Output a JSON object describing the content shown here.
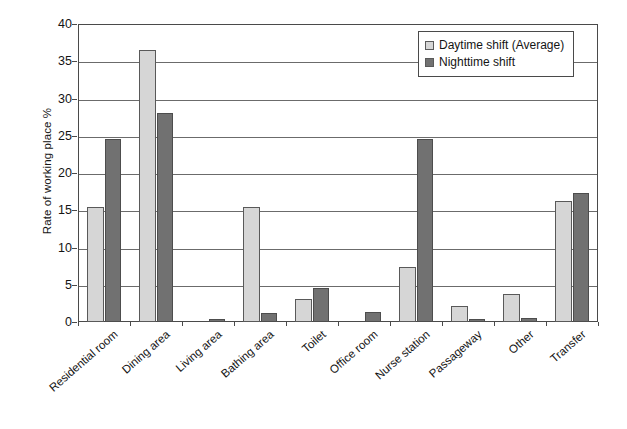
{
  "chart_data": {
    "type": "bar",
    "title": "",
    "xlabel": "",
    "ylabel": "Rate of working place  %",
    "ylim": [
      0,
      40
    ],
    "yticks": [
      0,
      5,
      10,
      15,
      20,
      25,
      30,
      35,
      40
    ],
    "ytick_labels": [
      "0",
      "5",
      "10",
      "15",
      "20",
      "25",
      "30",
      "35",
      "40"
    ],
    "grid": true,
    "legend_position": "top-right",
    "categories": [
      "Residential room",
      "Dining area",
      "Living area",
      "Bathing area",
      "Toilet",
      "Office room",
      "Nurse station",
      "Passageway",
      "Other",
      "Transfer"
    ],
    "series": [
      {
        "name": "Daytime shift (Average)",
        "color": "#d6d6d6",
        "values": [
          15.4,
          36.5,
          0.0,
          15.4,
          3.1,
          0.0,
          7.4,
          2.2,
          3.8,
          16.3
        ]
      },
      {
        "name": "Nighttime shift",
        "color": "#717171",
        "values": [
          24.5,
          28.0,
          0.4,
          1.2,
          4.6,
          1.4,
          24.6,
          0.4,
          0.5,
          17.3
        ]
      }
    ]
  },
  "legend": {
    "items": [
      {
        "label": "Daytime shift (Average)",
        "swatch": "light"
      },
      {
        "label": "Nighttime shift",
        "swatch": "dark"
      }
    ]
  },
  "axis": {
    "y_title": "Rate of working place  %"
  }
}
